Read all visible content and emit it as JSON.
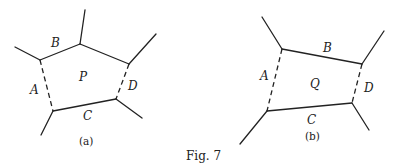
{
  "figure": {
    "caption": "Fig. 7",
    "stroke_color": "#222222",
    "panels": [
      {
        "id": "a",
        "sublabel": "(a)",
        "region_label": "P",
        "edges": [
          {
            "label": "A",
            "style": "dashed"
          },
          {
            "label": "B",
            "style": "solid"
          },
          {
            "label": "C",
            "style": "solid"
          },
          {
            "label": "D",
            "style": "dashed"
          }
        ]
      },
      {
        "id": "b",
        "sublabel": "(b)",
        "region_label": "Q",
        "edges": [
          {
            "label": "A",
            "style": "dashed"
          },
          {
            "label": "B",
            "style": "solid"
          },
          {
            "label": "C",
            "style": "solid"
          },
          {
            "label": "D",
            "style": "dashed"
          }
        ]
      }
    ]
  }
}
